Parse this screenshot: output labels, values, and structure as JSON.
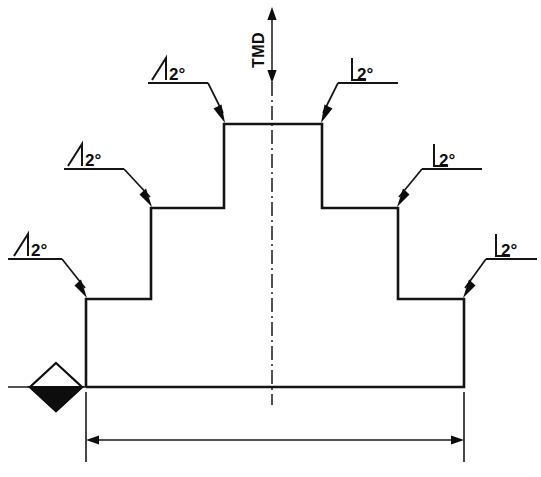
{
  "drawing": {
    "title": "Stepped taper profile — sectional view",
    "background_color": "#ffffff",
    "line_color": "#141414",
    "canvas": {
      "width": 541,
      "height": 477
    }
  },
  "vertical_dimension": {
    "label": "TMD",
    "name": "tmd-dimension",
    "orientation": "vertical",
    "text_rotation_deg": -90,
    "arrow_both_ends": true
  },
  "centerline": {
    "name": "centerline",
    "style": "dash-dot",
    "x": 272,
    "y_top": 82,
    "y_bottom": 405
  },
  "annotations": [
    {
      "id": "taper-top-left",
      "symbol": "taper-angle-icon",
      "value": "2",
      "unit": "°",
      "text": "2°",
      "side": "left",
      "text_x": 172,
      "text_y": 78,
      "underline_x1": 148,
      "underline_x2": 208,
      "underline_y": 83,
      "leader_bend_x": 208,
      "target_x": 224,
      "target_y": 124
    },
    {
      "id": "taper-top-right",
      "symbol": "taper-angle-icon",
      "value": "2",
      "unit": "°",
      "text": "2°",
      "side": "right",
      "text_x": 356,
      "text_y": 78,
      "underline_x1": 338,
      "underline_x2": 398,
      "underline_y": 83,
      "leader_bend_x": 338,
      "target_x": 322,
      "target_y": 124
    },
    {
      "id": "taper-mid-left",
      "symbol": "taper-angle-icon",
      "value": "2",
      "unit": "°",
      "text": "2°",
      "side": "left",
      "text_x": 88,
      "text_y": 164,
      "underline_x1": 64,
      "underline_x2": 124,
      "underline_y": 169,
      "leader_bend_x": 124,
      "target_x": 151,
      "target_y": 208
    },
    {
      "id": "taper-mid-right",
      "symbol": "taper-angle-icon",
      "value": "2",
      "unit": "°",
      "text": "2°",
      "side": "right",
      "text_x": 438,
      "text_y": 164,
      "underline_x1": 422,
      "underline_x2": 482,
      "underline_y": 169,
      "leader_bend_x": 422,
      "target_x": 398,
      "target_y": 208
    },
    {
      "id": "taper-base-left",
      "symbol": "taper-angle-icon",
      "value": "2",
      "unit": "°",
      "text": "2°",
      "side": "left",
      "text_x": 24,
      "text_y": 254,
      "underline_x1": 8,
      "underline_x2": 62,
      "underline_y": 259,
      "leader_bend_x": 62,
      "target_x": 86,
      "target_y": 299
    },
    {
      "id": "taper-base-right",
      "symbol": "taper-angle-icon",
      "value": "2",
      "unit": "°",
      "text": "2°",
      "side": "right",
      "text_x": 500,
      "text_y": 254,
      "underline_x1": 486,
      "underline_x2": 537,
      "underline_y": 259,
      "leader_bend_x": 486,
      "target_x": 464,
      "target_y": 299
    }
  ],
  "profile": {
    "name": "part-outline",
    "description": "symmetric three-step stepped profile",
    "baseline_y": 387,
    "points": [
      [
        86,
        387
      ],
      [
        86,
        299
      ],
      [
        151,
        299
      ],
      [
        151,
        208
      ],
      [
        224,
        208
      ],
      [
        224,
        124
      ],
      [
        322,
        124
      ],
      [
        322,
        208
      ],
      [
        398,
        208
      ],
      [
        398,
        299
      ],
      [
        464,
        299
      ],
      [
        464,
        387
      ],
      [
        86,
        387
      ]
    ]
  },
  "datum_symbol": {
    "name": "datum-diamond",
    "description": "half-filled diamond datum marker on baseline",
    "center_x": 56,
    "center_y": 387,
    "half_width": 26,
    "half_height": 24,
    "leader_x1": 8,
    "leader_x2": 86,
    "fill_color": "#0d0d0d"
  },
  "width_dimension": {
    "name": "overall-width-dimension",
    "label": "",
    "line_y": 440,
    "x1": 86,
    "x2": 464,
    "ext_top_y": 392,
    "ext_bottom_y": 462,
    "arrow_both_ends": true
  }
}
